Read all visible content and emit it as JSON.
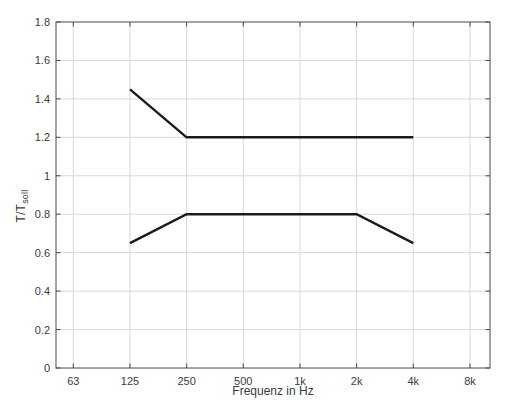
{
  "figure": {
    "background": "#ffffff",
    "axis_color": "#4a4a4a",
    "grid_color": "#d7d7d7",
    "line_color": "#1b1b1b",
    "tick_label_color": "#3a3a3a"
  },
  "chart_data": {
    "type": "line",
    "title": "",
    "xlabel": "Frequenz in Hz",
    "ylabel_main": "T/T",
    "ylabel_sub": "soll",
    "x_scale": "log-octave",
    "grid": true,
    "legend": "none",
    "ylim": [
      0,
      1.8
    ],
    "x_ticks": [
      {
        "f": 63,
        "label": "63"
      },
      {
        "f": 125,
        "label": "125"
      },
      {
        "f": 250,
        "label": "250"
      },
      {
        "f": 500,
        "label": "500"
      },
      {
        "f": 1000,
        "label": "1k"
      },
      {
        "f": 2000,
        "label": "2k"
      },
      {
        "f": 4000,
        "label": "4k"
      },
      {
        "f": 8000,
        "label": "8k"
      }
    ],
    "y_ticks": [
      {
        "v": 0,
        "label": "0"
      },
      {
        "v": 0.2,
        "label": "0.2"
      },
      {
        "v": 0.4,
        "label": "0.4"
      },
      {
        "v": 0.6,
        "label": "0.6"
      },
      {
        "v": 0.8,
        "label": "0.8"
      },
      {
        "v": 1,
        "label": "1"
      },
      {
        "v": 1.2,
        "label": "1.2"
      },
      {
        "v": 1.4,
        "label": "1.4"
      },
      {
        "v": 1.6,
        "label": "1.6"
      },
      {
        "v": 1.8,
        "label": "1.8"
      }
    ],
    "series": [
      {
        "name": "upper-tolerance-limit",
        "points": [
          [
            125,
            1.45
          ],
          [
            250,
            1.2
          ],
          [
            4000,
            1.2
          ]
        ]
      },
      {
        "name": "lower-tolerance-limit",
        "points": [
          [
            125,
            0.65
          ],
          [
            250,
            0.8
          ],
          [
            2000,
            0.8
          ],
          [
            4000,
            0.65
          ]
        ]
      }
    ]
  }
}
